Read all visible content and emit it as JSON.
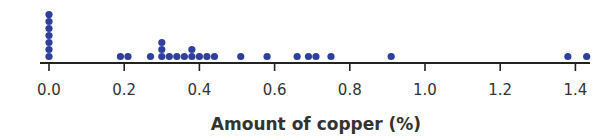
{
  "chart_data": {
    "type": "scatter",
    "subtype": "dot_plot",
    "title": "",
    "xlabel": "Amount of copper (%)",
    "ylabel": "",
    "xlim": [
      0.0,
      1.45
    ],
    "xticks": [
      0.0,
      0.2,
      0.4,
      0.6,
      0.8,
      1.0,
      1.2,
      1.4
    ],
    "xtick_labels": [
      "0.0",
      "0.2",
      "0.4",
      "0.6",
      "0.8",
      "1.0",
      "1.2",
      "1.4"
    ],
    "grid": false,
    "legend": null,
    "dot_color": "#2f3f9e",
    "points": [
      {
        "x": 0.0,
        "count": 7
      },
      {
        "x": 0.19,
        "count": 1
      },
      {
        "x": 0.21,
        "count": 1
      },
      {
        "x": 0.27,
        "count": 1
      },
      {
        "x": 0.3,
        "count": 3
      },
      {
        "x": 0.32,
        "count": 1
      },
      {
        "x": 0.34,
        "count": 1
      },
      {
        "x": 0.36,
        "count": 1
      },
      {
        "x": 0.38,
        "count": 2
      },
      {
        "x": 0.4,
        "count": 1
      },
      {
        "x": 0.42,
        "count": 1
      },
      {
        "x": 0.44,
        "count": 1
      },
      {
        "x": 0.51,
        "count": 1
      },
      {
        "x": 0.58,
        "count": 1
      },
      {
        "x": 0.66,
        "count": 1
      },
      {
        "x": 0.69,
        "count": 1
      },
      {
        "x": 0.71,
        "count": 1
      },
      {
        "x": 0.75,
        "count": 1
      },
      {
        "x": 0.91,
        "count": 1
      },
      {
        "x": 1.38,
        "count": 1
      },
      {
        "x": 1.43,
        "count": 1
      }
    ],
    "total_points": 30
  }
}
